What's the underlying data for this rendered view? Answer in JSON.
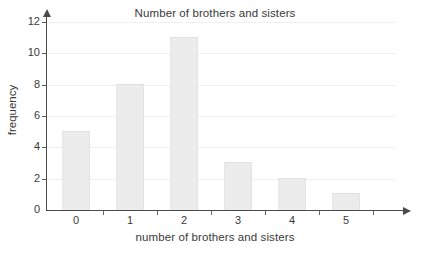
{
  "chart_data": {
    "type": "bar",
    "title": "Number of brothers and sisters",
    "xlabel": "number of brothers and sisters",
    "ylabel": "frequency",
    "categories": [
      "0",
      "1",
      "2",
      "3",
      "4",
      "5"
    ],
    "values": [
      5,
      8,
      11,
      3,
      2,
      1
    ],
    "ylim": [
      0,
      12
    ],
    "y_ticks": [
      "0",
      "2",
      "4",
      "6",
      "8",
      "10",
      "12"
    ],
    "grid": true,
    "legend": null,
    "colors": {
      "bar_fill": "#ececec",
      "bar_edge": "#e0e0e0",
      "axis": "#4a4a4a",
      "gridline": "#f0f0f0",
      "text": "#3a3a3a",
      "background": "#ffffff"
    }
  }
}
